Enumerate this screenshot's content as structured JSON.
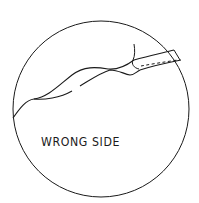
{
  "diagram": {
    "type": "sewing-detail-magnifier",
    "label": "WRONG SIDE",
    "colors": {
      "ink": "#1a1a1a",
      "background": "#ffffff"
    },
    "elements": [
      {
        "name": "magnifier-circle",
        "description": "circular detail frame"
      },
      {
        "name": "fabric-fold-edge",
        "description": "wavy fold edge of fabric"
      },
      {
        "name": "seam-band",
        "description": "band with dashed stitching line"
      },
      {
        "name": "stitch-line",
        "description": "dashed stitching"
      },
      {
        "name": "thread-tail",
        "description": "thread end near seam"
      }
    ]
  }
}
